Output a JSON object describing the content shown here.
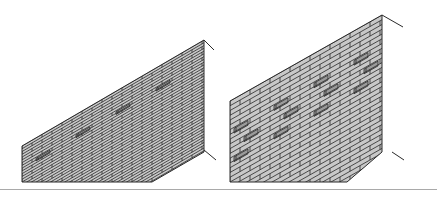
{
  "figure": {
    "colors": {
      "brick_fill": "#c8c8c8",
      "mortar_line": "#2a2a2a",
      "recess_fill": "#9a9a9a",
      "divider": "#a9a9a9",
      "background": "#ffffff"
    },
    "walls": [
      {
        "id": "wall-left",
        "label": "",
        "front_left_x": 22,
        "bottom_y": 182,
        "front_left_top_y": 146,
        "right_x": 204,
        "right_top_y": 40,
        "right_bottom_y": 152,
        "bottom_right_x": 152,
        "courses": 13,
        "brick_len": 20,
        "recess_rows": [
          7
        ],
        "recess_step": 2,
        "top_tick": [
          [
            204,
            40
          ],
          [
            214,
            50
          ]
        ],
        "bottom_tick": [
          [
            204,
            150
          ],
          [
            216,
            160
          ]
        ]
      },
      {
        "id": "wall-right",
        "label": "",
        "front_left_x": 230,
        "bottom_y": 182,
        "front_left_top_y": 101,
        "right_x": 382,
        "right_top_y": 15,
        "right_bottom_y": 152,
        "bottom_right_x": 347,
        "courses": 17,
        "brick_len": 20,
        "recess_rows": [
          6,
          9,
          12
        ],
        "recess_step": 2,
        "top_tick": [
          [
            382,
            15
          ],
          [
            403,
            27
          ]
        ],
        "bottom_tick": [
          [
            392,
            152
          ],
          [
            404,
            160
          ]
        ]
      }
    ]
  }
}
